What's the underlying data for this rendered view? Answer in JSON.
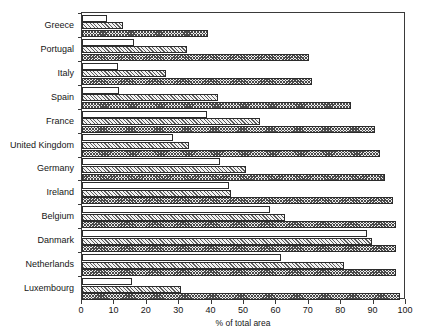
{
  "chart_data": {
    "type": "bar",
    "orientation": "horizontal",
    "title": "",
    "subtitle": "",
    "xlabel": "% of total area",
    "ylabel": "",
    "xlim": [
      0,
      100
    ],
    "xticks": [
      0,
      10,
      20,
      30,
      40,
      50,
      60,
      70,
      80,
      90,
      100
    ],
    "xtick_labels": [
      "0",
      "10",
      "20",
      "30",
      "40",
      "50",
      "60",
      "70",
      "80",
      "90",
      "100"
    ],
    "grid": false,
    "legend": null,
    "legend_position": "none",
    "categories": [
      "Greece",
      "Portugal",
      "Italy",
      "Spain",
      "France",
      "United Kingdom",
      "Germany",
      "Ireland",
      "Belgium",
      "Danmark",
      "Netherlands",
      "Luxembourg"
    ],
    "series": [
      {
        "name": "series-1",
        "pattern": "blank",
        "values": [
          7.7,
          16.0,
          11.0,
          11.5,
          38.5,
          28.0,
          42.5,
          45.5,
          58.0,
          88.0,
          61.5,
          15.5
        ]
      },
      {
        "name": "series-2",
        "pattern": "diagonal-hatch",
        "values": [
          12.7,
          32.5,
          26.0,
          42.0,
          55.0,
          33.0,
          50.5,
          46.0,
          62.5,
          89.5,
          81.0,
          30.5
        ]
      },
      {
        "name": "series-3",
        "pattern": "cross-dot",
        "values": [
          39.0,
          70.0,
          71.0,
          83.0,
          90.5,
          92.0,
          93.5,
          96.0,
          97.0,
          97.0,
          97.0,
          98.0
        ]
      }
    ]
  },
  "colors": {
    "axis": "#3a3a3a",
    "bar_outline": "#2b2b2b",
    "text": "#151515",
    "background": "#ffffff"
  }
}
